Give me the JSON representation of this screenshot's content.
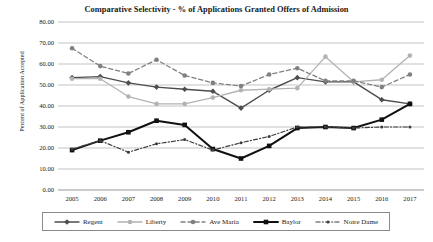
{
  "chart_data": {
    "type": "line",
    "title": "Comparative Selectivity - % of Applications Granted Offers of Admission",
    "xlabel": "",
    "ylabel": "Percent of Application Accepted",
    "x": [
      2005,
      2006,
      2007,
      2008,
      2009,
      2010,
      2011,
      2012,
      2013,
      2014,
      2015,
      2016,
      2017
    ],
    "categories": [
      "2005",
      "2006",
      "2007",
      "2008",
      "2009",
      "2010",
      "2011",
      "2012",
      "2013",
      "2014",
      "2015",
      "2016",
      "2017"
    ],
    "ylim": [
      0,
      80
    ],
    "ytick_labels": [
      "0.00",
      "10.00",
      "20.00",
      "30.00",
      "40.00",
      "50.00",
      "60.00",
      "70.00",
      "80.00"
    ],
    "ytick_values": [
      0,
      10,
      20,
      30,
      40,
      50,
      60,
      70,
      80
    ],
    "grid": true,
    "legend_position": "bottom",
    "series": [
      {
        "name": "Regent",
        "color": "#4d4d4d",
        "line_style": "solid",
        "line_width": 1.4,
        "marker": "diamond",
        "values": [
          53.5,
          54.0,
          51.0,
          49.0,
          48.0,
          47.0,
          39.0,
          47.5,
          53.5,
          51.5,
          51.5,
          43.0,
          41.0
        ]
      },
      {
        "name": "Liberty",
        "color": "#b3b3b3",
        "line_style": "solid",
        "line_width": 1.3,
        "marker": "circle",
        "values": [
          53.0,
          53.0,
          44.5,
          41.0,
          41.0,
          44.0,
          47.5,
          48.0,
          48.5,
          63.5,
          51.5,
          52.5,
          64.0
        ]
      },
      {
        "name": "Ave Maria",
        "color": "#808080",
        "line_style": "dashed",
        "line_width": 1.3,
        "marker": "circle",
        "values": [
          67.5,
          59.0,
          55.5,
          62.0,
          54.5,
          51.0,
          49.5,
          55.0,
          58.0,
          52.0,
          52.0,
          49.0,
          55.0
        ]
      },
      {
        "name": "Baylor",
        "color": "#111111",
        "line_style": "solid",
        "line_width": 2.0,
        "marker": "square",
        "values": [
          19.0,
          23.5,
          27.5,
          33.0,
          31.0,
          19.5,
          15.0,
          21.0,
          29.5,
          30.0,
          29.5,
          33.5,
          41.0
        ]
      },
      {
        "name": "Notre Dame",
        "color": "#3d3d3d",
        "line_style": "dashdot",
        "line_width": 1.2,
        "marker": "small-circle",
        "values": [
          19.5,
          23.5,
          18.0,
          22.0,
          24.0,
          19.0,
          22.5,
          25.5,
          30.0,
          30.0,
          29.5,
          30.0,
          30.0
        ]
      }
    ]
  },
  "legend": {
    "items": [
      {
        "label": "Regent"
      },
      {
        "label": "Liberty"
      },
      {
        "label": "Ave Maria"
      },
      {
        "label": "Baylor"
      },
      {
        "label": "Notre Dame"
      }
    ]
  }
}
